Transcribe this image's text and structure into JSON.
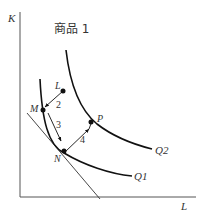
{
  "title": "商品 1",
  "axes": {
    "y_label": "K",
    "x_label": "L"
  },
  "curves": [
    {
      "name": "Q1",
      "label": "Q1"
    },
    {
      "name": "Q2",
      "label": "Q2"
    }
  ],
  "points": {
    "L": "L",
    "M": "M",
    "N": "N",
    "P": "P"
  },
  "steps": [
    "2",
    "3",
    "4"
  ],
  "colors": {
    "line": "#111111",
    "axis": "#555555",
    "text": "#333333"
  }
}
